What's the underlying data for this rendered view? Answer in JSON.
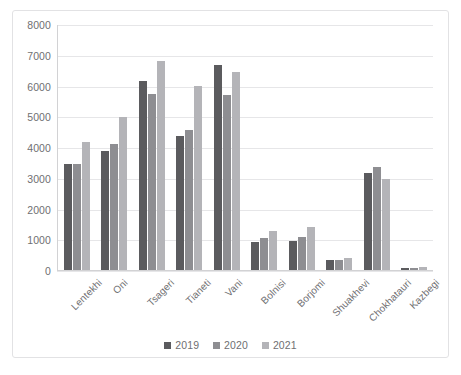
{
  "chart_data": {
    "type": "bar",
    "title": "",
    "subtitle": "",
    "xlabel": "",
    "ylabel": "",
    "ylim": [
      0,
      8000
    ],
    "ytick_values": [
      0,
      1000,
      2000,
      3000,
      4000,
      5000,
      6000,
      7000,
      8000
    ],
    "ytick_labels": [
      "0",
      "1000",
      "2000",
      "3000",
      "4000",
      "5000",
      "6000",
      "7000",
      "8000"
    ],
    "grid": true,
    "legend_position": "bottom",
    "categories": [
      "Lentekhi",
      "Oni",
      "Tsageri",
      "Tianeti",
      "Vani",
      "Bolnisi",
      "Borjomi",
      "Shuakhevi",
      "Chokhatauri",
      "Kazbegi"
    ],
    "series": [
      {
        "name": "2019",
        "color": "#5b5b5e",
        "values": [
          3450,
          3880,
          6170,
          4380,
          6680,
          900,
          950,
          320,
          3180,
          80
        ]
      },
      {
        "name": "2020",
        "color": "#8e8e92",
        "values": [
          3450,
          4120,
          5750,
          4570,
          5700,
          1050,
          1090,
          330,
          3370,
          80
        ]
      },
      {
        "name": "2021",
        "color": "#b4b4b8",
        "values": [
          4180,
          5010,
          6830,
          6000,
          6450,
          1270,
          1420,
          400,
          2980,
          110
        ]
      }
    ]
  },
  "legend": {
    "entries": [
      {
        "label": "2019"
      },
      {
        "label": "2020"
      },
      {
        "label": "2021"
      }
    ]
  },
  "colors": {
    "series_2019": "#5b5b5e",
    "series_2020": "#8e8e92",
    "series_2021": "#b4b4b8",
    "gridline": "#e6e6e8",
    "axis": "#d2d2d4",
    "text": "#6f6f72",
    "frame_border": "#e2e2e4",
    "background": "#ffffff"
  }
}
